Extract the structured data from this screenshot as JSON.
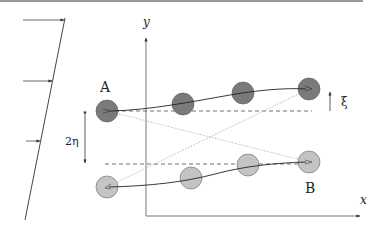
{
  "diagram": {
    "labels": {
      "point_a": "A",
      "point_b": "B",
      "x_axis": "x",
      "y_axis": "y",
      "separation": "2η",
      "displacement": "ξ"
    },
    "colors": {
      "upper_particles": "#7a7a7a",
      "lower_particles": "#c4c4c4",
      "stroke": "#333333",
      "dotted": "#aaaaaa",
      "top_rule": "#999999"
    },
    "upper_row": [
      {
        "x": 107,
        "y": 111
      },
      {
        "x": 183,
        "y": 104
      },
      {
        "x": 243,
        "y": 93
      },
      {
        "x": 309,
        "y": 89
      }
    ],
    "lower_row": [
      {
        "x": 107,
        "y": 187
      },
      {
        "x": 191,
        "y": 178
      },
      {
        "x": 248,
        "y": 165
      },
      {
        "x": 309,
        "y": 162
      }
    ],
    "shear_arrows": [
      {
        "y": 20,
        "x_start": 23,
        "x_end": 65
      },
      {
        "y": 81,
        "x_start": 23,
        "x_end": 53
      },
      {
        "y": 141,
        "x_start": 26,
        "x_end": 41
      }
    ]
  }
}
